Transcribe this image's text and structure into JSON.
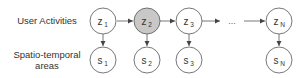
{
  "rows": {
    "top_label": "User Activities",
    "bottom_label_line1": "Spatio-temporal",
    "bottom_label_line2": "areas"
  },
  "nodes": {
    "z": [
      {
        "base": "z",
        "sub": "1",
        "observed": false
      },
      {
        "base": "z",
        "sub": "2",
        "observed": true
      },
      {
        "base": "z",
        "sub": "3",
        "observed": false
      },
      {
        "base": "z",
        "sub": "N",
        "observed": false
      }
    ],
    "s": [
      {
        "base": "s",
        "sub": "1"
      },
      {
        "base": "s",
        "sub": "2"
      },
      {
        "base": "s",
        "sub": "3"
      },
      {
        "base": "s",
        "sub": "N"
      }
    ]
  },
  "ellipsis": "...",
  "colors": {
    "stroke": "#555555",
    "shaded_fill": "#c8c8c8",
    "text": "#333333"
  }
}
